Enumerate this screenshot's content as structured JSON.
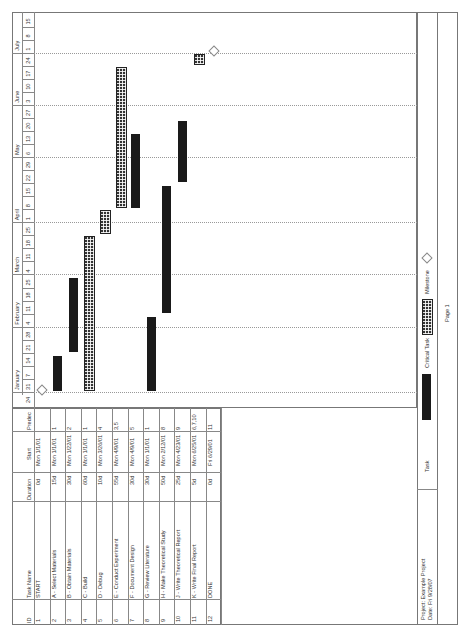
{
  "table": {
    "headers": {
      "id": "ID",
      "task_name": "Task Name",
      "duration": "Duration",
      "start": "Start",
      "predecessors": "Predec"
    },
    "rows": [
      {
        "id": "1",
        "name": "START",
        "duration": "0d",
        "start": "Mon 1/1/01",
        "pred": ""
      },
      {
        "id": "2",
        "name": "A - Select Materials",
        "duration": "15d",
        "start": "Mon 1/1/01",
        "pred": "1"
      },
      {
        "id": "3",
        "name": "B - Obtain Materials",
        "duration": "30d",
        "start": "Mon 1/22/01",
        "pred": "2"
      },
      {
        "id": "4",
        "name": "C - Build",
        "duration": "60d",
        "start": "Mon 1/1/01",
        "pred": "1"
      },
      {
        "id": "5",
        "name": "D - Debug",
        "duration": "10d",
        "start": "Mon 3/26/01",
        "pred": "4"
      },
      {
        "id": "6",
        "name": "E - Conduct Experiment",
        "duration": "55d",
        "start": "Mon 4/9/01",
        "pred": "3,5"
      },
      {
        "id": "7",
        "name": "F - Document Design",
        "duration": "30d",
        "start": "Mon 4/9/01",
        "pred": "5"
      },
      {
        "id": "8",
        "name": "G - Review Literature",
        "duration": "30d",
        "start": "Mon 1/1/01",
        "pred": "1"
      },
      {
        "id": "9",
        "name": "H - Make Theoretical Study",
        "duration": "50d",
        "start": "Mon 2/12/01",
        "pred": "8"
      },
      {
        "id": "10",
        "name": "J - Write Theoretical Report",
        "duration": "25d",
        "start": "Mon 4/23/01",
        "pred": "9"
      },
      {
        "id": "11",
        "name": "K - Write Final Report",
        "duration": "5d",
        "start": "Mon 6/25/01",
        "pred": "6,7,10"
      },
      {
        "id": "12",
        "name": "DONE",
        "duration": "0d",
        "start": "Fri 6/29/01",
        "pred": "11"
      }
    ]
  },
  "timescale": {
    "months": [
      {
        "label": "January",
        "start_week": 1,
        "span": 5
      },
      {
        "label": "February",
        "start_week": 6,
        "span": 4
      },
      {
        "label": "March",
        "start_week": 10,
        "span": 4
      },
      {
        "label": "April",
        "start_week": 14,
        "span": 5
      },
      {
        "label": "May",
        "start_week": 19,
        "span": 4
      },
      {
        "label": "June",
        "start_week": 23,
        "span": 4
      },
      {
        "label": "July",
        "start_week": 27,
        "span": 3
      }
    ],
    "weeks": [
      "24",
      "31",
      "7",
      "14",
      "21",
      "28",
      "4",
      "11",
      "18",
      "25",
      "4",
      "11",
      "18",
      "25",
      "1",
      "8",
      "15",
      "22",
      "29",
      "6",
      "13",
      "20",
      "27",
      "3",
      "10",
      "17",
      "24",
      "1",
      "8",
      "15"
    ]
  },
  "legend": {
    "project": "Project: Example Project",
    "date": "Date: Fri 9/28/07",
    "task_label": "Task",
    "critical_label": "Critical Task",
    "milestone_label": "Milestone"
  },
  "footer": {
    "page": "Page 1"
  },
  "colors": {
    "task_bar": "#1a1a1a",
    "critical_bar": "#333333",
    "grid": "#999999",
    "border": "#777777"
  },
  "chart_data": {
    "type": "gantt",
    "title": "Example Project",
    "x_axis": "Calendar weeks (Dec 24, 2000 – Jul 15, 2001)",
    "tasks": [
      {
        "id": 1,
        "name": "START",
        "start": "2001-01-01",
        "end": "2001-01-01",
        "kind": "milestone"
      },
      {
        "id": 2,
        "name": "A - Select Materials",
        "start": "2001-01-01",
        "end": "2001-01-19",
        "kind": "task"
      },
      {
        "id": 3,
        "name": "B - Obtain Materials",
        "start": "2001-01-22",
        "end": "2001-03-02",
        "kind": "task"
      },
      {
        "id": 4,
        "name": "C - Build",
        "start": "2001-01-01",
        "end": "2001-03-23",
        "kind": "critical"
      },
      {
        "id": 5,
        "name": "D - Debug",
        "start": "2001-03-26",
        "end": "2001-04-06",
        "kind": "critical"
      },
      {
        "id": 6,
        "name": "E - Conduct Experiment",
        "start": "2001-04-09",
        "end": "2001-06-22",
        "kind": "critical"
      },
      {
        "id": 7,
        "name": "F - Document Design",
        "start": "2001-04-09",
        "end": "2001-05-18",
        "kind": "task"
      },
      {
        "id": 8,
        "name": "G - Review Literature",
        "start": "2001-01-01",
        "end": "2001-02-09",
        "kind": "task"
      },
      {
        "id": 9,
        "name": "H - Make Theoretical Study",
        "start": "2001-02-12",
        "end": "2001-04-20",
        "kind": "task"
      },
      {
        "id": 10,
        "name": "J - Write Theoretical Report",
        "start": "2001-04-23",
        "end": "2001-05-25",
        "kind": "task"
      },
      {
        "id": 11,
        "name": "K - Write Final Report",
        "start": "2001-06-25",
        "end": "2001-06-29",
        "kind": "critical"
      },
      {
        "id": 12,
        "name": "DONE",
        "start": "2001-06-29",
        "end": "2001-06-29",
        "kind": "milestone"
      }
    ],
    "legend": [
      "Task",
      "Critical Task",
      "Milestone"
    ],
    "grid": "dotted month separators"
  }
}
